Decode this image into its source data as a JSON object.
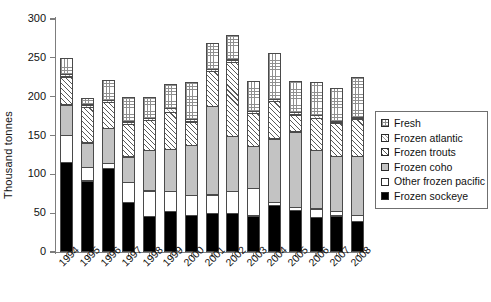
{
  "chart_data": {
    "type": "bar",
    "subtype": "stacked-bar",
    "title": "",
    "xlabel": "",
    "ylabel": "Thousand tonnes",
    "ylim": [
      0,
      300
    ],
    "yticks": [
      0,
      50,
      100,
      150,
      200,
      250,
      300
    ],
    "grid": false,
    "legend_position": "right",
    "categories": [
      "1994",
      "1995",
      "1996",
      "1997",
      "1998",
      "1999",
      "2000",
      "2001",
      "2002",
      "2003",
      "2004",
      "2005",
      "2006",
      "2007",
      "2008"
    ],
    "series": [
      {
        "name": "Frozen sockeye",
        "pattern": "solid-black",
        "color": "#000000",
        "values": [
          116,
          92,
          108,
          64,
          46,
          53,
          48,
          50,
          50,
          47,
          60,
          54,
          45,
          47,
          40
        ]
      },
      {
        "name": "Other frozen pacific",
        "pattern": "solid-white",
        "color": "#ffffff",
        "values": [
          36,
          18,
          8,
          27,
          34,
          26,
          26,
          25,
          29,
          36,
          5,
          5,
          12,
          7,
          9
        ]
      },
      {
        "name": "Frozen coho",
        "pattern": "solid-gray",
        "color": "#c3c3c3",
        "values": [
          40,
          33,
          46,
          34,
          53,
          56,
          66,
          115,
          72,
          55,
          83,
          98,
          76,
          72,
          77
        ]
      },
      {
        "name": "Frozen trouts",
        "pattern": "diagonal-hatch",
        "color": "#5a5a5a",
        "values": [
          37,
          47,
          34,
          43,
          40,
          48,
          31,
          46,
          97,
          44,
          49,
          23,
          43,
          43,
          49
        ]
      },
      {
        "name": "Frozen atlantic",
        "pattern": "fine-diagonal",
        "color": "#9a9a9a",
        "values": [
          4,
          4,
          4,
          4,
          4,
          6,
          4,
          4,
          4,
          4,
          4,
          4,
          4,
          3,
          3
        ]
      },
      {
        "name": "Fresh",
        "pattern": "cross-grid",
        "color": "#8f8f8f",
        "values": [
          22,
          9,
          27,
          33,
          28,
          33,
          49,
          34,
          33,
          39,
          60,
          41,
          44,
          44,
          53
        ]
      }
    ],
    "totals": [
      255,
      203,
      227,
      205,
      205,
      222,
      224,
      274,
      285,
      225,
      261,
      225,
      224,
      216,
      231
    ]
  },
  "legend": {
    "items": [
      {
        "label": "Fresh",
        "swatch": "fresh-swatch"
      },
      {
        "label": "Frozen atlantic",
        "swatch": "frozen-atlantic-swatch"
      },
      {
        "label": "Frozen trouts",
        "swatch": "frozen-trouts-swatch"
      },
      {
        "label": "Frozen coho",
        "swatch": "frozen-coho-swatch"
      },
      {
        "label": "Other frozen pacific",
        "swatch": "other-frozen-pacific-swatch"
      },
      {
        "label": "Frozen sockeye",
        "swatch": "frozen-sockeye-swatch"
      }
    ]
  }
}
